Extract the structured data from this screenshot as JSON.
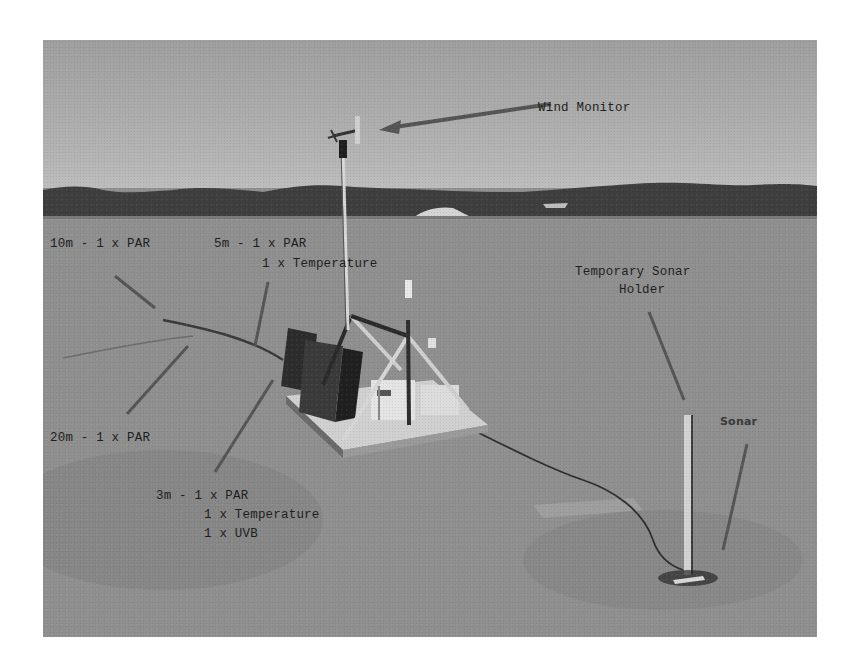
{
  "image": {
    "description": "Grayscale photo of a sea-ice monitoring station with annotated instruments",
    "palette": {
      "sky": "#b0b0b0",
      "hills": "#3c3c3c",
      "ice": "#8a8a8a",
      "labels": "#1e1e1e",
      "page_background": "#ffffff"
    }
  },
  "annotations": {
    "wind_monitor": "Wind Monitor",
    "sensor_10m": "10m - 1 x PAR",
    "sensor_5m_line1": "5m - 1 x PAR",
    "sensor_5m_line2": "1 x Temperature",
    "sonar_holder_line1": "Temporary Sonar",
    "sonar_holder_line2": "Holder",
    "sensor_20m": "20m - 1 x PAR",
    "sonar": "Sonar",
    "sensor_3m_line1": "3m - 1 x PAR",
    "sensor_3m_line2": "1 x Temperature",
    "sensor_3m_line3": "1 x UVB"
  }
}
